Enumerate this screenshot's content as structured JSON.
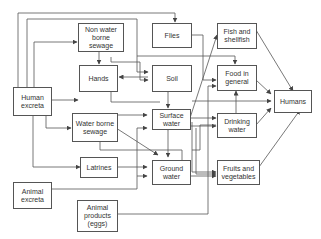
{
  "nodes": {
    "human_excreta": "Human\nexcreta",
    "non_water_borne_sewage": "Non water\nborne\nsewage",
    "hands": "Hands",
    "water_borne_sewage": "Water borne\nsewage",
    "latrines": "Latrines",
    "animal_excreta": "Animal\nexcreta",
    "animal_products": "Animal\nproducts\n(eggs)",
    "flies": "Flies",
    "soil": "Soil",
    "surface_water": "Surface\nwater",
    "ground_water": "Ground\nwater",
    "fish_and_shellfish": "Fish and\nshellfish",
    "food_in_general": "Food in\ngeneral",
    "drinking_water": "Drinking\nwater",
    "fruits_and_vegetables": "Fruits and\nvegetables",
    "humans": "Humans"
  },
  "colors": {
    "line": "#555555",
    "text": "#333333",
    "background": "#ffffff"
  }
}
